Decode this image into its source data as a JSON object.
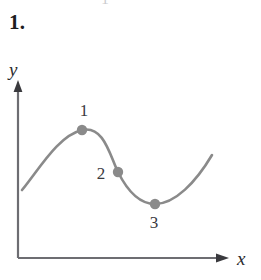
{
  "figure": {
    "problem_number": "1.",
    "top_artifact_glyph": "1",
    "background_color": "#ffffff"
  },
  "axes": {
    "x_label": "x",
    "y_label": "y",
    "axis_color": "#6d6d72",
    "origin": {
      "x": 18,
      "y": 258
    },
    "x_axis_end": {
      "x": 228,
      "y": 258
    },
    "y_axis_end": {
      "x": 18,
      "y": 82
    }
  },
  "curve": {
    "color": "#8a8a8a",
    "stroke_width": 2.6,
    "path": "M 22 190 C 40 168, 58 136, 82 130 C 104 125, 110 156, 118 172 C 128 192, 140 204, 155 204 C 175 204, 196 182, 212 155"
  },
  "points": [
    {
      "label": "1",
      "x": 82,
      "y": 130,
      "label_x": 84,
      "label_y": 116,
      "role": "local-maximum"
    },
    {
      "label": "2",
      "x": 118,
      "y": 172,
      "label_x": 101,
      "label_y": 179,
      "role": "inflection"
    },
    {
      "label": "3",
      "x": 155,
      "y": 204,
      "label_x": 154,
      "label_y": 228,
      "role": "local-minimum"
    }
  ],
  "point_style": {
    "fill": "#8a8a8a",
    "radius": 5.2
  },
  "chart_data": {
    "type": "line",
    "title": "",
    "xlabel": "x",
    "ylabel": "y",
    "grid": false,
    "legend": null,
    "axis_arrows": true,
    "tick_labels": {
      "x": [],
      "y": []
    },
    "annotations": [
      {
        "text": "1",
        "position": "above-point",
        "refers_to": "local maximum"
      },
      {
        "text": "2",
        "position": "left-of-point",
        "refers_to": "inflection point"
      },
      {
        "text": "3",
        "position": "below-point",
        "refers_to": "local minimum"
      }
    ],
    "marked_points": [
      {
        "label": "1",
        "feature": "local maximum",
        "x": 0.3,
        "y": 0.78
      },
      {
        "label": "2",
        "feature": "inflection",
        "x": 0.48,
        "y": 0.49
      },
      {
        "label": "3",
        "feature": "local minimum",
        "x": 0.65,
        "y": 0.31
      }
    ],
    "x": [
      0.02,
      0.1,
      0.2,
      0.3,
      0.38,
      0.48,
      0.58,
      0.65,
      0.75,
      0.85,
      0.93
    ],
    "y": [
      0.39,
      0.55,
      0.71,
      0.78,
      0.69,
      0.49,
      0.36,
      0.31,
      0.36,
      0.51,
      0.61
    ]
  }
}
